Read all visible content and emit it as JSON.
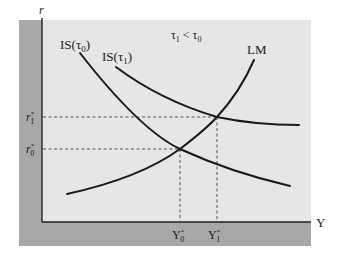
{
  "diagram": {
    "condition": "τ1 < τ0",
    "axes": {
      "x_label": "Y",
      "y_label": "r"
    },
    "curves": [
      {
        "id": "is0",
        "label": "IS(τ0)",
        "label_main": "IS(τ",
        "label_sub": "0",
        "label_close": ")"
      },
      {
        "id": "is1",
        "label": "IS(τ1)",
        "label_main": "IS(τ",
        "label_sub": "1",
        "label_close": ")"
      },
      {
        "id": "lm",
        "label": "LM"
      }
    ],
    "equilibria": [
      {
        "r_label": "r0*",
        "r_main": "r",
        "r_sub": "0",
        "y_label": "Y0*",
        "y_main": "Y",
        "y_sub": "0"
      },
      {
        "r_label": "r1*",
        "r_main": "r",
        "r_sub": "1",
        "y_label": "Y1*",
        "y_main": "Y",
        "y_sub": "1"
      }
    ],
    "colors": {
      "plot_bg": "#e8e8e8",
      "axis_band": "#a6a6a6",
      "curve": "#1a1a1a",
      "dashed": "#555555"
    }
  }
}
